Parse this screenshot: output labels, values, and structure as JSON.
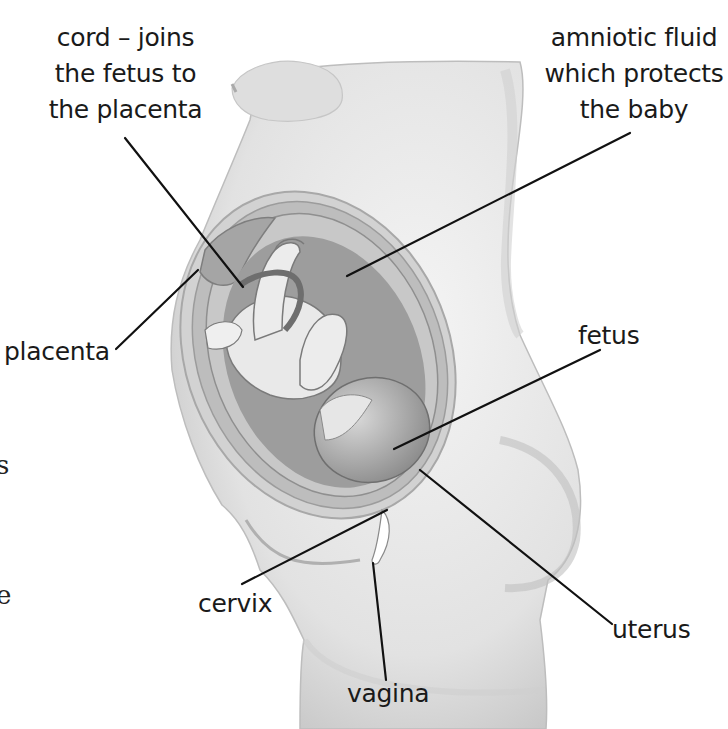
{
  "diagram": {
    "colors": {
      "line": "#111111",
      "skin_light": "#ececec",
      "skin_mid": "#c9c9c9",
      "skin_dark": "#9a9a9a",
      "uterus_wall": "#b5b5b5",
      "fluid": "#8f8f8f",
      "fetus": "#e6e6e6"
    },
    "labels": [
      {
        "id": "cord",
        "lines": [
          "cord – joins",
          "the fetus to",
          "the placenta"
        ],
        "leader": {
          "x1": 125,
          "y1": 138,
          "x2": 243,
          "y2": 287
        }
      },
      {
        "id": "amniotic-fluid",
        "lines": [
          "amniotic fluid",
          "which protects",
          "the baby"
        ],
        "leader": {
          "x1": 630,
          "y1": 133,
          "x2": 347,
          "y2": 276
        }
      },
      {
        "id": "placenta",
        "lines": [
          "placenta"
        ],
        "leader": {
          "x1": 116,
          "y1": 349,
          "x2": 198,
          "y2": 270
        }
      },
      {
        "id": "fetus",
        "lines": [
          "fetus"
        ],
        "leader": {
          "x1": 600,
          "y1": 350,
          "x2": 394,
          "y2": 449
        }
      },
      {
        "id": "uterus",
        "lines": [
          "uterus"
        ],
        "leader": {
          "x1": 612,
          "y1": 624,
          "x2": 420,
          "y2": 470
        }
      },
      {
        "id": "cervix",
        "lines": [
          "cervix"
        ],
        "leader": {
          "x1": 242,
          "y1": 584,
          "x2": 387,
          "y2": 510
        }
      },
      {
        "id": "vagina",
        "lines": [
          "vagina"
        ],
        "leader": {
          "x1": 386,
          "y1": 680,
          "x2": 373,
          "y2": 563
        }
      }
    ],
    "clipped_edge_text": [
      "s",
      "e"
    ]
  }
}
